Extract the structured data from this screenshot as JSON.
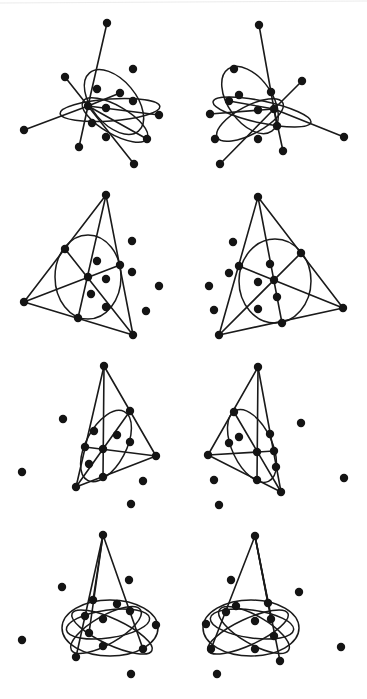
{
  "figure": {
    "caption_cut": "",
    "colors": {
      "ink": "#141414",
      "line": "#1a1a1a",
      "background": "#ffffff"
    },
    "node_radius": 4.2,
    "panels": [
      {
        "id": "row1-left",
        "view": "left-eye",
        "nodes": [
          [
            107,
            23
          ],
          [
            65,
            77
          ],
          [
            133,
            69
          ],
          [
            97,
            89
          ],
          [
            120,
            93
          ],
          [
            133,
            101
          ],
          [
            88,
            106
          ],
          [
            106,
            108
          ],
          [
            159,
            115
          ],
          [
            24,
            130
          ],
          [
            92,
            123
          ],
          [
            106,
            137
          ],
          [
            147,
            139
          ],
          [
            79,
            147
          ],
          [
            134,
            164
          ]
        ],
        "edges": [
          [
            6,
            0
          ],
          [
            6,
            1
          ],
          [
            6,
            9
          ],
          [
            6,
            8
          ],
          [
            6,
            13
          ],
          [
            6,
            14
          ],
          [
            6,
            4
          ],
          [
            6,
            12
          ]
        ],
        "ellipses": [
          {
            "cx": 114,
            "cy": 102,
            "rx": 22,
            "ry": 38,
            "rot": -40
          },
          {
            "cx": 110,
            "cy": 110,
            "rx": 50,
            "ry": 11,
            "rot": -4
          },
          {
            "cx": 115,
            "cy": 120,
            "rx": 37,
            "ry": 14,
            "rot": 30
          }
        ]
      },
      {
        "id": "row1-right",
        "view": "right-eye",
        "nodes": [
          [
            259,
            25
          ],
          [
            234,
            69
          ],
          [
            302,
            81
          ],
          [
            271,
            92
          ],
          [
            239,
            95
          ],
          [
            229,
            101
          ],
          [
            274,
            109
          ],
          [
            258,
            110
          ],
          [
            210,
            114
          ],
          [
            277,
            126
          ],
          [
            215,
            139
          ],
          [
            258,
            139
          ],
          [
            344,
            137
          ],
          [
            283,
            151
          ],
          [
            220,
            164
          ]
        ],
        "edges": [
          [
            6,
            0
          ],
          [
            6,
            2
          ],
          [
            6,
            8
          ],
          [
            6,
            12
          ],
          [
            6,
            13
          ],
          [
            6,
            14
          ],
          [
            6,
            5
          ],
          [
            6,
            9
          ]
        ],
        "ellipses": [
          {
            "cx": 250,
            "cy": 100,
            "rx": 22,
            "ry": 38,
            "rot": -35
          },
          {
            "cx": 262,
            "cy": 112,
            "rx": 50,
            "ry": 11,
            "rot": 12
          },
          {
            "cx": 250,
            "cy": 120,
            "rx": 37,
            "ry": 14,
            "rot": -28
          }
        ]
      },
      {
        "id": "row2-left",
        "view": "left-eye",
        "nodes": [
          [
            106,
            195
          ],
          [
            132,
            241
          ],
          [
            65,
            249
          ],
          [
            97,
            261
          ],
          [
            120,
            265
          ],
          [
            132,
            272
          ],
          [
            88,
            277
          ],
          [
            106,
            279
          ],
          [
            24,
            302
          ],
          [
            159,
            286
          ],
          [
            91,
            294
          ],
          [
            106,
            307
          ],
          [
            146,
            311
          ],
          [
            78,
            318
          ],
          [
            133,
            335
          ]
        ],
        "edges": [
          [
            0,
            8
          ],
          [
            0,
            14
          ],
          [
            8,
            14
          ],
          [
            0,
            13
          ],
          [
            2,
            14
          ],
          [
            8,
            4
          ]
        ],
        "ellipses": [
          {
            "cx": 88,
            "cy": 277,
            "rx": 33,
            "ry": 42,
            "rot": 0
          }
        ]
      },
      {
        "id": "row2-right",
        "view": "right-eye",
        "nodes": [
          [
            258,
            197
          ],
          [
            233,
            242
          ],
          [
            301,
            253
          ],
          [
            270,
            264
          ],
          [
            239,
            266
          ],
          [
            229,
            273
          ],
          [
            274,
            280
          ],
          [
            258,
            282
          ],
          [
            209,
            286
          ],
          [
            277,
            297
          ],
          [
            214,
            310
          ],
          [
            258,
            309
          ],
          [
            343,
            308
          ],
          [
            282,
            323
          ],
          [
            219,
            335
          ]
        ],
        "edges": [
          [
            0,
            14
          ],
          [
            0,
            12
          ],
          [
            14,
            12
          ],
          [
            0,
            13
          ],
          [
            4,
            12
          ],
          [
            14,
            2
          ]
        ],
        "ellipses": [
          {
            "cx": 275,
            "cy": 281,
            "rx": 36,
            "ry": 42,
            "rot": 0
          }
        ]
      },
      {
        "id": "row3-left",
        "view": "left-eye",
        "nodes": [
          [
            104,
            366
          ],
          [
            63,
            419
          ],
          [
            130,
            411
          ],
          [
            94,
            431
          ],
          [
            117,
            435
          ],
          [
            130,
            442
          ],
          [
            85,
            447
          ],
          [
            103,
            449
          ],
          [
            156,
            456
          ],
          [
            89,
            464
          ],
          [
            22,
            472
          ],
          [
            103,
            477
          ],
          [
            143,
            481
          ],
          [
            76,
            487
          ],
          [
            131,
            504
          ]
        ],
        "edges": [
          [
            0,
            13
          ],
          [
            0,
            8
          ],
          [
            13,
            8
          ],
          [
            0,
            11
          ],
          [
            6,
            8
          ],
          [
            13,
            2
          ]
        ],
        "ellipses": [
          {
            "cx": 106,
            "cy": 446,
            "rx": 20,
            "ry": 39,
            "rot": 28
          }
        ]
      },
      {
        "id": "row3-right",
        "view": "right-eye",
        "nodes": [
          [
            258,
            367
          ],
          [
            234,
            412
          ],
          [
            301,
            423
          ],
          [
            270,
            434
          ],
          [
            239,
            437
          ],
          [
            229,
            443
          ],
          [
            257,
            452
          ],
          [
            274,
            451
          ],
          [
            208,
            455
          ],
          [
            276,
            467
          ],
          [
            214,
            480
          ],
          [
            257,
            480
          ],
          [
            344,
            478
          ],
          [
            281,
            492
          ],
          [
            219,
            505
          ]
        ],
        "edges": [
          [
            0,
            8
          ],
          [
            0,
            13
          ],
          [
            8,
            13
          ],
          [
            0,
            11
          ],
          [
            8,
            7
          ],
          [
            1,
            13
          ]
        ],
        "ellipses": [
          {
            "cx": 252,
            "cy": 446,
            "rx": 20,
            "ry": 39,
            "rot": -25
          }
        ]
      },
      {
        "id": "row4-left",
        "view": "left-eye",
        "nodes": [
          [
            103,
            535
          ],
          [
            129,
            580
          ],
          [
            62,
            587
          ],
          [
            93,
            600
          ],
          [
            117,
            604
          ],
          [
            130,
            611
          ],
          [
            85,
            616
          ],
          [
            103,
            619
          ],
          [
            156,
            625
          ],
          [
            89,
            633
          ],
          [
            22,
            640
          ],
          [
            103,
            646
          ],
          [
            143,
            649
          ],
          [
            76,
            657
          ],
          [
            131,
            674
          ]
        ],
        "edges": [
          [
            0,
            13
          ],
          [
            0,
            12
          ],
          [
            0,
            3
          ],
          [
            0,
            9
          ]
        ],
        "ellipses": [
          {
            "cx": 110,
            "cy": 628,
            "rx": 48,
            "ry": 28,
            "rot": 0
          },
          {
            "cx": 108,
            "cy": 624,
            "rx": 42,
            "ry": 14,
            "rot": -8
          },
          {
            "cx": 112,
            "cy": 632,
            "rx": 44,
            "ry": 13,
            "rot": 25
          },
          {
            "cx": 106,
            "cy": 630,
            "rx": 40,
            "ry": 14,
            "rot": -30
          }
        ]
      },
      {
        "id": "row4-right",
        "view": "right-eye",
        "nodes": [
          [
            255,
            536
          ],
          [
            231,
            580
          ],
          [
            299,
            592
          ],
          [
            268,
            603
          ],
          [
            236,
            606
          ],
          [
            226,
            612
          ],
          [
            271,
            619
          ],
          [
            255,
            621
          ],
          [
            206,
            624
          ],
          [
            274,
            636
          ],
          [
            211,
            649
          ],
          [
            255,
            649
          ],
          [
            341,
            647
          ],
          [
            280,
            661
          ],
          [
            217,
            674
          ]
        ],
        "edges": [
          [
            0,
            10
          ],
          [
            0,
            13
          ],
          [
            0,
            3
          ],
          [
            0,
            6
          ]
        ],
        "ellipses": [
          {
            "cx": 251,
            "cy": 628,
            "rx": 48,
            "ry": 28,
            "rot": 0
          },
          {
            "cx": 252,
            "cy": 624,
            "rx": 42,
            "ry": 14,
            "rot": 8
          },
          {
            "cx": 248,
            "cy": 632,
            "rx": 44,
            "ry": 13,
            "rot": -25
          },
          {
            "cx": 254,
            "cy": 630,
            "rx": 40,
            "ry": 14,
            "rot": 30
          }
        ]
      }
    ]
  }
}
